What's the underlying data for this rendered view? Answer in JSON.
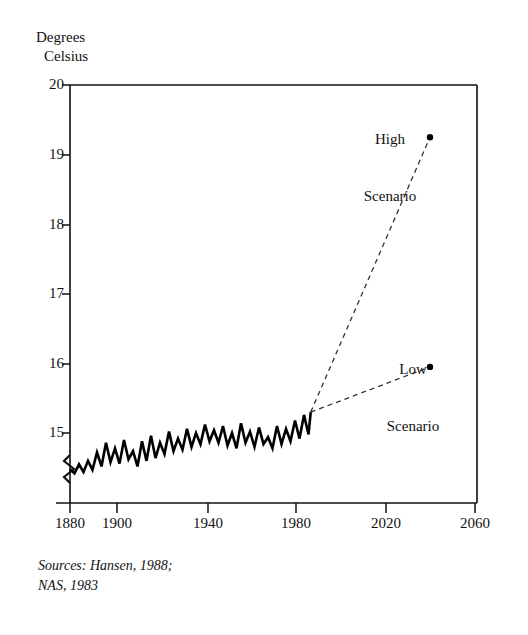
{
  "chart_data": {
    "type": "line",
    "title": "",
    "ylabel": "Degrees Celsius",
    "ylabel_line1": "Degrees",
    "ylabel_line2": "Celsius",
    "xlabel": "",
    "ylim": [
      14.2,
      20
    ],
    "xlim": [
      1877,
      2060
    ],
    "y_axis_broken": true,
    "y_break_note": "axis break (zigzag) just below 15 on the vertical axis",
    "yticks": [
      15,
      16,
      17,
      18,
      19,
      20
    ],
    "ytick_labels": [
      "15",
      "16",
      "17",
      "18",
      "19",
      "20"
    ],
    "xticks": [
      1880,
      1900,
      1940,
      1980,
      2020,
      2060
    ],
    "xtick_labels": [
      "1880",
      "1900",
      "1940",
      "1980",
      "2020",
      "2060"
    ],
    "grid": false,
    "legend": "none",
    "series": [
      {
        "name": "Observed global mean temperature",
        "style": "solid",
        "x": [
          1880,
          1882,
          1884,
          1886,
          1888,
          1890,
          1892,
          1894,
          1896,
          1898,
          1900,
          1902,
          1904,
          1906,
          1908,
          1910,
          1912,
          1914,
          1916,
          1918,
          1920,
          1922,
          1924,
          1926,
          1928,
          1930,
          1932,
          1934,
          1936,
          1938,
          1940,
          1942,
          1944,
          1946,
          1948,
          1950,
          1952,
          1954,
          1956,
          1958,
          1960,
          1962,
          1964,
          1966,
          1968,
          1970,
          1972,
          1974,
          1976,
          1978,
          1980,
          1982,
          1984,
          1986,
          1987
        ],
        "y": [
          14.48,
          14.42,
          14.55,
          14.44,
          14.6,
          14.47,
          14.72,
          14.52,
          14.86,
          14.58,
          14.78,
          14.56,
          14.9,
          14.62,
          14.74,
          14.52,
          14.88,
          14.6,
          14.96,
          14.64,
          14.86,
          14.7,
          15.02,
          14.74,
          14.92,
          14.76,
          15.06,
          14.8,
          15.0,
          14.84,
          15.12,
          14.88,
          15.04,
          14.86,
          15.1,
          14.82,
          15.0,
          14.78,
          15.14,
          14.86,
          15.02,
          14.8,
          15.08,
          14.84,
          14.94,
          14.78,
          15.1,
          14.84,
          15.06,
          14.88,
          15.18,
          14.92,
          15.26,
          14.98,
          15.3
        ]
      },
      {
        "name": "High Scenario",
        "style": "dashed",
        "x": [
          1987,
          2040
        ],
        "y": [
          15.3,
          19.25
        ],
        "endpoint_marker": "dot",
        "label": "High\nScenario"
      },
      {
        "name": "Low Scenario",
        "style": "dashed",
        "x": [
          1987,
          2040
        ],
        "y": [
          15.3,
          15.95
        ],
        "endpoint_marker": "dot",
        "label": "Low\nScenario"
      }
    ],
    "annotations": [
      {
        "name": "high-scenario-label",
        "text": "High\nScenario",
        "line1": "High",
        "line2": "Scenario"
      },
      {
        "name": "low-scenario-label",
        "text": "Low\nScenario",
        "line1": "Low",
        "line2": "Scenario"
      }
    ]
  },
  "axis_titles": {
    "y_line1": "Degrees",
    "y_line2": "Celsius"
  },
  "ytick_labels": {
    "t20": "20",
    "t19": "19",
    "t18": "18",
    "t17": "17",
    "t16": "16",
    "t15": "15"
  },
  "xtick_labels": {
    "t1880": "1880",
    "t1900": "1900",
    "t1940": "1940",
    "t1980": "1980",
    "t2020": "2020",
    "t2060": "2060"
  },
  "annotations": {
    "high_line1": "High",
    "high_line2": "Scenario",
    "low_line1": "Low",
    "low_line2": "Scenario"
  },
  "source": {
    "text": "Sources: Hansen, 1988;\nNAS, 1983"
  },
  "colors": {
    "ink": "#111111",
    "background": "#ffffff",
    "series_line": "#000000",
    "projection_line": "#333333"
  }
}
